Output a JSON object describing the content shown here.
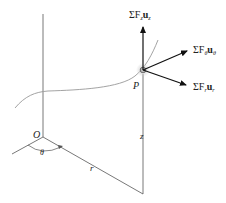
{
  "diagram": {
    "type": "cylindrical-coordinate-force-diagram",
    "labels": {
      "origin": "O",
      "point": "P",
      "theta": "θ",
      "r": "r",
      "z": "z"
    },
    "forces": {
      "z": {
        "sigma": "ΣF",
        "sub": "z",
        "unit": "u",
        "unit_sub": "z"
      },
      "theta": {
        "sigma": "ΣF",
        "sub": "θ",
        "unit": "u",
        "unit_sub": "θ"
      },
      "r": {
        "sigma": "ΣF",
        "sub": "r",
        "unit": "u",
        "unit_sub": "r"
      }
    },
    "colors": {
      "line": "#555555",
      "arrow": "#111111",
      "curve": "#888888"
    }
  }
}
